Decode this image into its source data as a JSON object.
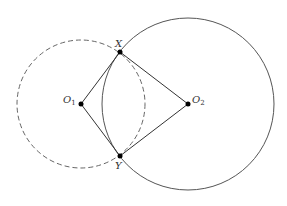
{
  "diagram": {
    "circle1": {
      "cx": 81,
      "cy": 104,
      "r": 64,
      "style": "dashed",
      "color": "#666666"
    },
    "circle2": {
      "cx": 188,
      "cy": 104,
      "r": 86,
      "style": "solid",
      "color": "#555555"
    },
    "points": {
      "X": {
        "x": 120,
        "y": 52
      },
      "Y": {
        "x": 120,
        "y": 156
      },
      "O1": {
        "x": 81,
        "y": 104
      },
      "O2": {
        "x": 188,
        "y": 104
      }
    },
    "labels": {
      "X": "X",
      "Y": "Y",
      "O1_main": "O",
      "O1_sub": "1",
      "O2_main": "O",
      "O2_sub": "2"
    },
    "segments": [
      "O1-X",
      "O1-Y",
      "O2-X",
      "O2-Y"
    ]
  }
}
